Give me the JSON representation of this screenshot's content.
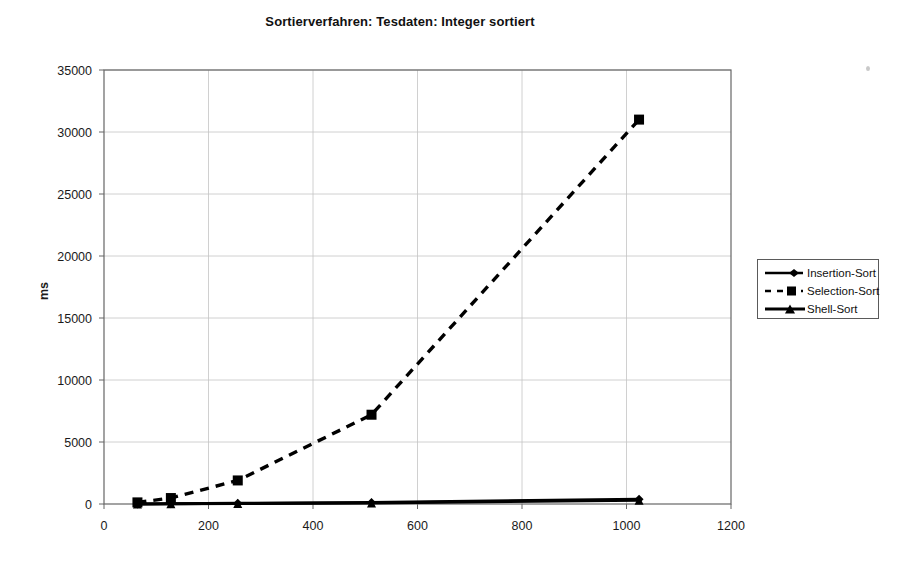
{
  "chart_data": {
    "type": "line",
    "title": "Sortierverfahren: Tesdaten: Integer sortiert",
    "xlabel": "",
    "ylabel": "ms",
    "xlim": [
      0,
      1200
    ],
    "ylim": [
      0,
      35000
    ],
    "xticks": [
      0,
      200,
      400,
      600,
      800,
      1000,
      1200
    ],
    "yticks": [
      0,
      5000,
      10000,
      15000,
      20000,
      25000,
      30000,
      35000
    ],
    "xtick_labels": [
      "0",
      "200",
      "400",
      "600",
      "800",
      "1000",
      "1200"
    ],
    "ytick_labels": [
      "0",
      "5000",
      "10000",
      "15000",
      "20000",
      "25000",
      "30000",
      "35000"
    ],
    "grid": true,
    "legend_position": "right",
    "x": [
      64,
      128,
      256,
      512,
      1024
    ],
    "series": [
      {
        "name": "Insertion-Sort",
        "marker": "diamond",
        "linestyle": "solid",
        "color": "#000000",
        "values": [
          10,
          30,
          60,
          130,
          380
        ]
      },
      {
        "name": "Selection-Sort",
        "marker": "square",
        "linestyle": "dashed",
        "color": "#000000",
        "values": [
          130,
          480,
          1900,
          7200,
          31000
        ]
      },
      {
        "name": "Shell-Sort",
        "marker": "triangle",
        "linestyle": "solid",
        "color": "#000000",
        "values": [
          5,
          15,
          35,
          90,
          300
        ]
      }
    ]
  },
  "legend": {
    "entries": [
      {
        "label": "Insertion-Sort"
      },
      {
        "label": "Selection-Sort"
      },
      {
        "label": "Shell-Sort"
      }
    ]
  }
}
